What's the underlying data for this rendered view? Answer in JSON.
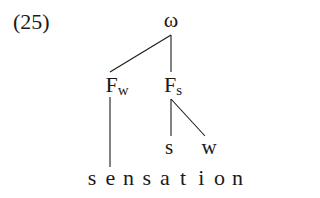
{
  "example": {
    "number": "(25)"
  },
  "tree": {
    "root": {
      "label": "ω"
    },
    "feet": [
      {
        "label": "F",
        "subscript": "w"
      },
      {
        "label": "F",
        "subscript": "s"
      }
    ],
    "syllable_marks": [
      {
        "label": "s"
      },
      {
        "label": "w"
      }
    ],
    "word": {
      "text": "sensation",
      "letters": [
        "s",
        "e",
        "n",
        "s",
        "a",
        "t",
        "i",
        "o",
        "n"
      ]
    }
  }
}
